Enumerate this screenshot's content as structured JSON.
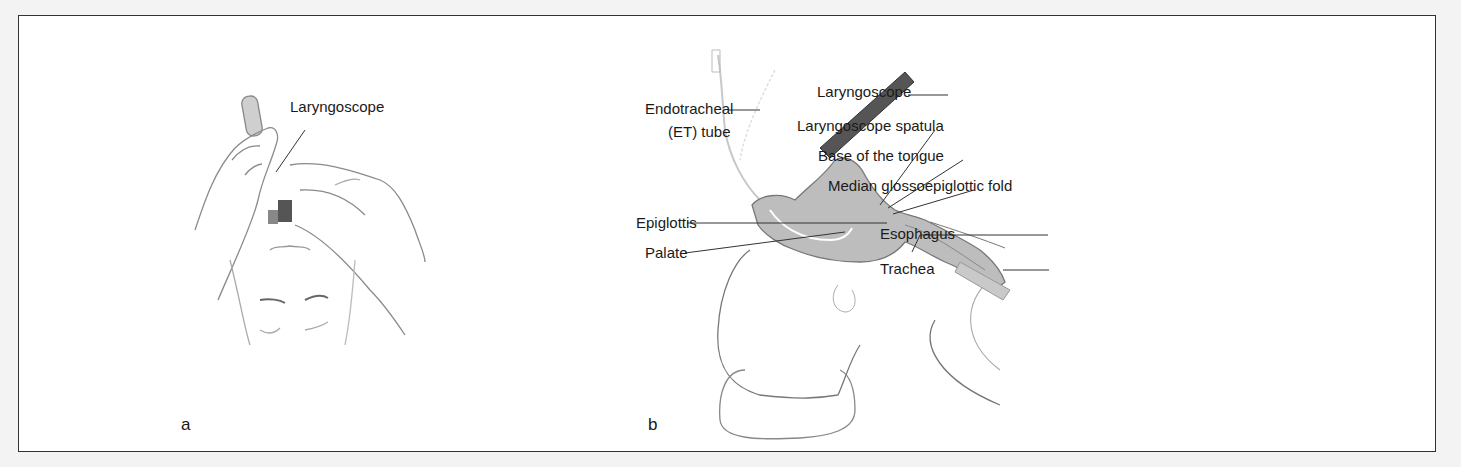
{
  "figure": {
    "panels": [
      {
        "id": "a",
        "letter": "a",
        "labels": [
          {
            "key": "laryngoscope",
            "text": "Laryngoscope"
          }
        ]
      },
      {
        "id": "b",
        "letter": "b",
        "labels": [
          {
            "key": "et_tube_line1",
            "text": "Endotracheal"
          },
          {
            "key": "et_tube_line2",
            "text": "(ET) tube"
          },
          {
            "key": "laryngoscope",
            "text": "Laryngoscope"
          },
          {
            "key": "spatula",
            "text": "Laryngoscope spatula"
          },
          {
            "key": "tongue_base",
            "text": "Base of the tongue"
          },
          {
            "key": "fold",
            "text": "Median glossoepiglottic fold"
          },
          {
            "key": "epiglottis",
            "text": "Epiglottis"
          },
          {
            "key": "palate",
            "text": "Palate"
          },
          {
            "key": "esophagus",
            "text": "Esophagus"
          },
          {
            "key": "trachea",
            "text": "Trachea"
          }
        ]
      }
    ]
  },
  "colors": {
    "border": "#333333",
    "background": "#ffffff",
    "page": "#f3f3f3",
    "airway_fill": "#b9b9b9",
    "line": "#555555"
  }
}
